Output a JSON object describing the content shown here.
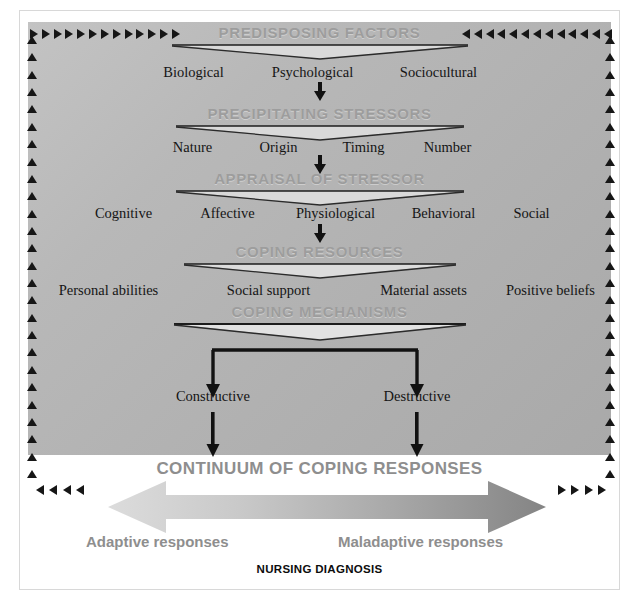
{
  "diagram": {
    "footer_label": "NURSING DIAGNOSIS",
    "background_color": "#b4b4b4",
    "stage_title_color": "#9d9d9d",
    "accent_dark": "#161616"
  },
  "stages": [
    {
      "title": "PREDISPOSING FACTORS",
      "options": [
        "Biological",
        "Psychological",
        "Sociocultural"
      ]
    },
    {
      "title": "PRECIPITATING STRESSORS",
      "options": [
        "Nature",
        "Origin",
        "Timing",
        "Number"
      ]
    },
    {
      "title": "APPRAISAL OF STRESSOR",
      "options": [
        "Cognitive",
        "Affective",
        "Physiological",
        "Behavioral",
        "Social"
      ]
    },
    {
      "title": "COPING RESOURCES",
      "options": [
        "Personal abilities",
        "Social support",
        "Material assets",
        "Positive beliefs"
      ]
    },
    {
      "title": "COPING MECHANISMS",
      "options": []
    }
  ],
  "outcomes": {
    "left": "Constructive",
    "right": "Destructive"
  },
  "continuum": {
    "title": "CONTINUUM OF COPING RESPONSES",
    "left_label": "Adaptive responses",
    "right_label": "Maladaptive responses",
    "gradient_start": "#d6d6d6",
    "gradient_end": "#888888"
  },
  "icons": {
    "triangle_right": "triangle-right-icon",
    "triangle_left": "triangle-left-icon",
    "triangle_up": "triangle-up-icon",
    "arrow_down": "arrow-down-icon",
    "double_arrow": "double-headed-arrow-icon"
  }
}
